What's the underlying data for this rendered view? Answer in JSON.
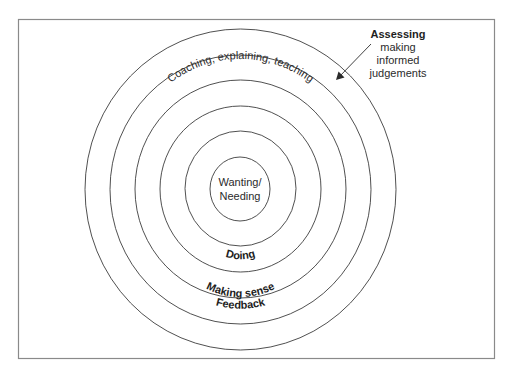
{
  "diagram": {
    "center_label": {
      "line1": "Wanting/",
      "line2": "Needing"
    },
    "ring_labels": {
      "doing": "Doing",
      "making_sense": "Making sense",
      "feedback": "Feedback",
      "coaching": "Coaching, explaining, teaching"
    },
    "assessing": {
      "title": "Assessing",
      "line1": "making",
      "line2": "informed",
      "line3": "judgements"
    },
    "rings": [
      {
        "name": "wanting-needing",
        "rx": 30,
        "ry": 32
      },
      {
        "name": "doing",
        "rx": 55.5,
        "ry": 57.5
      },
      {
        "name": "making-sense",
        "rx": 80.5,
        "ry": 83
      },
      {
        "name": "feedback",
        "rx": 105.5,
        "ry": 109
      },
      {
        "name": "coaching",
        "rx": 130.5,
        "ry": 134.5
      },
      {
        "name": "assessing",
        "rx": 155.5,
        "ry": 160.5
      }
    ],
    "colors": {
      "stroke": "#3c3c3c",
      "frame": "#8a8a8a",
      "text": "#2b2b2b",
      "background": "#ffffff"
    }
  }
}
